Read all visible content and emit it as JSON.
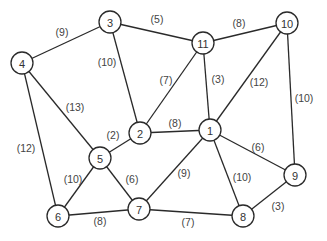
{
  "diagram": {
    "type": "weighted-undirected-graph",
    "node_radius": 11,
    "nodes": [
      {
        "id": "1",
        "label": "1",
        "x": 210,
        "y": 130
      },
      {
        "id": "2",
        "label": "2",
        "x": 140,
        "y": 133
      },
      {
        "id": "3",
        "label": "3",
        "x": 110,
        "y": 22
      },
      {
        "id": "4",
        "label": "4",
        "x": 22,
        "y": 63
      },
      {
        "id": "5",
        "label": "5",
        "x": 100,
        "y": 158
      },
      {
        "id": "6",
        "label": "6",
        "x": 58,
        "y": 216
      },
      {
        "id": "7",
        "label": "7",
        "x": 139,
        "y": 209
      },
      {
        "id": "8",
        "label": "8",
        "x": 243,
        "y": 216
      },
      {
        "id": "9",
        "label": "9",
        "x": 295,
        "y": 175
      },
      {
        "id": "10",
        "label": "10",
        "x": 287,
        "y": 23
      },
      {
        "id": "11",
        "label": "11",
        "x": 203,
        "y": 43
      }
    ],
    "edges": [
      {
        "from": "4",
        "to": "3",
        "weight": "(9)",
        "lx": 62,
        "ly": 32
      },
      {
        "from": "3",
        "to": "11",
        "weight": "(5)",
        "lx": 157,
        "ly": 19
      },
      {
        "from": "11",
        "to": "10",
        "weight": "(8)",
        "lx": 239,
        "ly": 23
      },
      {
        "from": "3",
        "to": "2",
        "weight": "(10)",
        "lx": 107,
        "ly": 62
      },
      {
        "from": "11",
        "to": "2",
        "weight": "(7)",
        "lx": 166,
        "ly": 80
      },
      {
        "from": "11",
        "to": "1",
        "weight": "(3)",
        "lx": 218,
        "ly": 79
      },
      {
        "from": "10",
        "to": "1",
        "weight": "(12)",
        "lx": 259,
        "ly": 82
      },
      {
        "from": "10",
        "to": "9",
        "weight": "(10)",
        "lx": 304,
        "ly": 98
      },
      {
        "from": "4",
        "to": "5",
        "weight": "(13)",
        "lx": 75,
        "ly": 107
      },
      {
        "from": "4",
        "to": "6",
        "weight": "(12)",
        "lx": 26,
        "ly": 148
      },
      {
        "from": "5",
        "to": "2",
        "weight": "(2)",
        "lx": 113,
        "ly": 135
      },
      {
        "from": "2",
        "to": "1",
        "weight": "(8)",
        "lx": 175,
        "ly": 123
      },
      {
        "from": "1",
        "to": "9",
        "weight": "(6)",
        "lx": 258,
        "ly": 147
      },
      {
        "from": "1",
        "to": "7",
        "weight": "(9)",
        "lx": 184,
        "ly": 173
      },
      {
        "from": "1",
        "to": "8",
        "weight": "(10)",
        "lx": 242,
        "ly": 177
      },
      {
        "from": "5",
        "to": "6",
        "weight": "(10)",
        "lx": 73,
        "ly": 179
      },
      {
        "from": "5",
        "to": "7",
        "weight": "(6)",
        "lx": 132,
        "ly": 179
      },
      {
        "from": "6",
        "to": "7",
        "weight": "(8)",
        "lx": 100,
        "ly": 221
      },
      {
        "from": "7",
        "to": "8",
        "weight": "(7)",
        "lx": 188,
        "ly": 222
      },
      {
        "from": "8",
        "to": "9",
        "weight": "(3)",
        "lx": 278,
        "ly": 206
      }
    ]
  }
}
